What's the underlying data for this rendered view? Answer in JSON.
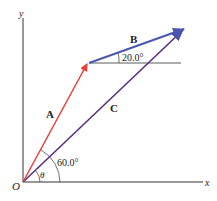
{
  "diagram": {
    "axes": {
      "x_label": "x",
      "y_label": "y",
      "origin_label": "O"
    },
    "vectors": [
      {
        "name": "A",
        "color": "#e8403a",
        "angle_deg": 60.0
      },
      {
        "name": "B",
        "color": "#4a55b0",
        "angle_deg": 20.0
      },
      {
        "name": "C",
        "color": "#5a2d82",
        "angle_label": "θ"
      }
    ],
    "angle_labels": {
      "a_angle": "60.0°",
      "b_angle": "20.0°",
      "theta": "θ"
    }
  }
}
